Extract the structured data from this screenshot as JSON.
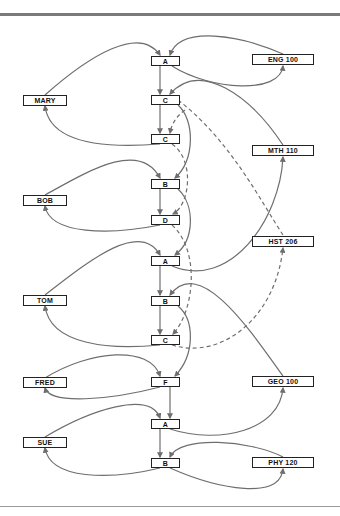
{
  "diagram": {
    "students": [
      {
        "id": "mary",
        "label": "MARY",
        "x": 23,
        "y": 95
      },
      {
        "id": "bob",
        "label": "BOB",
        "x": 23,
        "y": 195
      },
      {
        "id": "tom",
        "label": "TOM",
        "x": 23,
        "y": 295
      },
      {
        "id": "fred",
        "label": "FRED",
        "x": 23,
        "y": 377
      },
      {
        "id": "sue",
        "label": "SUE",
        "x": 23,
        "y": 437
      }
    ],
    "grades": [
      {
        "id": "g1",
        "label": "A",
        "x": 151,
        "y": 56
      },
      {
        "id": "g2",
        "label": "C",
        "x": 151,
        "y": 95
      },
      {
        "id": "g3",
        "label": "C",
        "x": 151,
        "y": 134
      },
      {
        "id": "g4",
        "label": "B",
        "x": 151,
        "y": 179
      },
      {
        "id": "g5",
        "label": "D",
        "x": 151,
        "y": 215
      },
      {
        "id": "g6",
        "label": "A",
        "x": 151,
        "y": 256
      },
      {
        "id": "g7",
        "label": "B",
        "x": 151,
        "y": 296
      },
      {
        "id": "g8",
        "label": "C",
        "x": 151,
        "y": 335
      },
      {
        "id": "g9",
        "label": "F",
        "x": 151,
        "y": 377
      },
      {
        "id": "g10",
        "label": "A",
        "x": 151,
        "y": 419
      },
      {
        "id": "g11",
        "label": "B",
        "x": 151,
        "y": 458
      }
    ],
    "courses": [
      {
        "id": "eng100",
        "label": "ENG 100",
        "x": 252,
        "y": 54
      },
      {
        "id": "mth110",
        "label": "MTH 110",
        "x": 252,
        "y": 145
      },
      {
        "id": "hst206",
        "label": "HST 206",
        "x": 252,
        "y": 236
      },
      {
        "id": "geo100",
        "label": "GEO 100",
        "x": 252,
        "y": 376
      },
      {
        "id": "phy120",
        "label": "PHY 120",
        "x": 252,
        "y": 457
      }
    ],
    "colors": {
      "edge": "#6e6e6e",
      "box_border": "#222222",
      "rule": "#7a7a7a"
    }
  }
}
